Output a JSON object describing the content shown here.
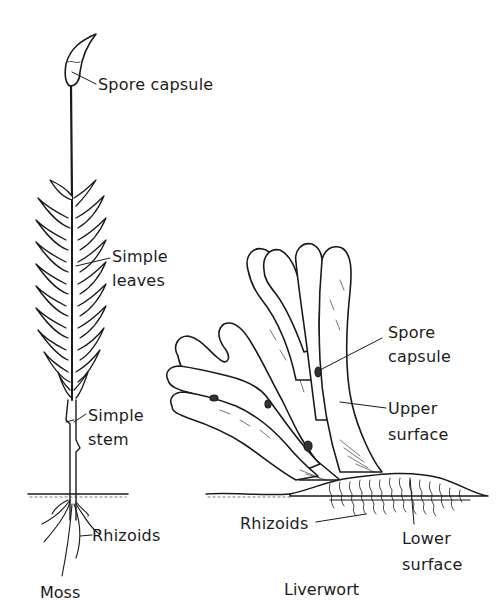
{
  "figure": {
    "moss": {
      "caption": "Moss",
      "labels": {
        "spore_capsule": "Spore capsule",
        "simple_leaves_1": "Simple",
        "simple_leaves_2": "leaves",
        "simple_stem_1": "Simple",
        "simple_stem_2": "stem",
        "rhizoids": "Rhizoids"
      }
    },
    "liverwort": {
      "caption": "Liverwort",
      "labels": {
        "spore_capsule_1": "Spore",
        "spore_capsule_2": "capsule",
        "upper_surface_1": "Upper",
        "upper_surface_2": "surface",
        "rhizoids": "Rhizoids",
        "lower_surface_1": "Lower",
        "lower_surface_2": "surface"
      }
    }
  }
}
